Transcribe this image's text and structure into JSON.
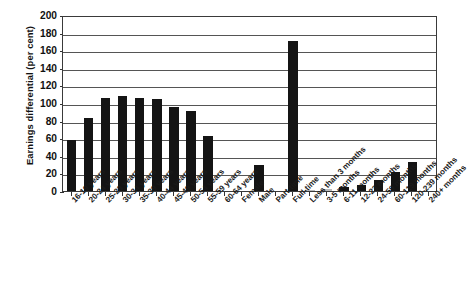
{
  "chart_data": {
    "type": "bar",
    "title": "",
    "xlabel": "",
    "ylabel": "Earnings differential (per cent)",
    "ylim": [
      0,
      200
    ],
    "ytick_step": 20,
    "yticks": [
      0,
      20,
      40,
      60,
      80,
      100,
      120,
      140,
      160,
      180,
      200
    ],
    "grid": true,
    "legend": "none",
    "bar_color": "#141414",
    "categories": [
      "16-19 years",
      "20-24 years",
      "25-23 years",
      "30-34 years",
      "35-39 years",
      "40-44 years",
      "45-49 years",
      "50-54 years",
      "55-59 years",
      "60-64 years",
      "Female",
      "Male",
      "Part-time",
      "Full-time",
      "Less than 3 months",
      "3-5 months",
      "6-11 months",
      "12-23 months",
      "24-59 months",
      "60-119 months",
      "120-239 months",
      "240+ months"
    ],
    "values": [
      58,
      83,
      106,
      108,
      106,
      105,
      96,
      91,
      63,
      0,
      0,
      30,
      0,
      170,
      1,
      2,
      4,
      7,
      13,
      22,
      33,
      0
    ],
    "note": "Bar slots with value 0 are empty/near-zero positions on the axis"
  },
  "axis": {
    "y_title": "Earnings differential (per cent)",
    "y_ticks": [
      "200",
      "180",
      "160",
      "140",
      "120",
      "100",
      "80",
      "60",
      "40",
      "20",
      "0"
    ]
  },
  "bars": [
    {
      "label": "16-19 years",
      "value": 58,
      "shade": "dark"
    },
    {
      "label": "20-24 years",
      "value": 83,
      "shade": "dark"
    },
    {
      "label": "25-23 years",
      "value": 106,
      "shade": "dark"
    },
    {
      "label": "30-34 years",
      "value": 108,
      "shade": "dark"
    },
    {
      "label": "35-39 years",
      "value": 106,
      "shade": "dark"
    },
    {
      "label": "40-44 years",
      "value": 105,
      "shade": "dark"
    },
    {
      "label": "45-49 years",
      "value": 96,
      "shade": "dark"
    },
    {
      "label": "50-54 years",
      "value": 91,
      "shade": "dark"
    },
    {
      "label": "55-59 years",
      "value": 63,
      "shade": "dark"
    },
    {
      "label": "60-64 years",
      "value": 0,
      "shade": "dark"
    },
    {
      "label": "Female",
      "value": 0,
      "shade": "dark"
    },
    {
      "label": "Male",
      "value": 30,
      "shade": "dark"
    },
    {
      "label": "Part-time",
      "value": 0,
      "shade": "dark"
    },
    {
      "label": "Full-time",
      "value": 170,
      "shade": "dark"
    },
    {
      "label": "Less than 3 months",
      "value": 1,
      "shade": "light"
    },
    {
      "label": "3-5 months",
      "value": 2,
      "shade": "light"
    },
    {
      "label": "6-11 months",
      "value": 4,
      "shade": "dark"
    },
    {
      "label": "12-23 months",
      "value": 7,
      "shade": "dark"
    },
    {
      "label": "24-59 months",
      "value": 13,
      "shade": "dark"
    },
    {
      "label": "60-119 months",
      "value": 22,
      "shade": "dark"
    },
    {
      "label": "120-239 months",
      "value": 33,
      "shade": "dark"
    },
    {
      "label": "240+ months",
      "value": 0,
      "shade": "dark"
    }
  ]
}
